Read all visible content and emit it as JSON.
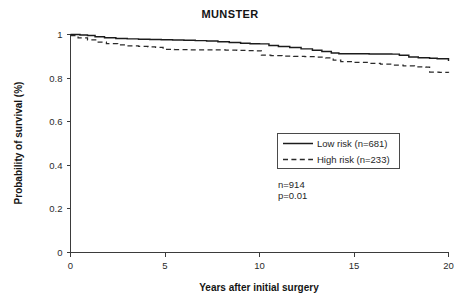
{
  "figure": {
    "background_color": "#ffffff",
    "line_color": "#1c1c1c"
  },
  "chart_data": {
    "type": "line",
    "title": "MUNSTER",
    "xlabel": "Years after initial surgery",
    "ylabel": "Probability of survival (%)",
    "xlim": [
      0,
      20
    ],
    "ylim": [
      0,
      1
    ],
    "xticks": [
      0,
      5,
      10,
      15,
      20
    ],
    "xtick_labels": [
      "0",
      "5",
      "10",
      "15",
      "20"
    ],
    "yticks": [
      0,
      0.2,
      0.4,
      0.6,
      0.8,
      1
    ],
    "ytick_labels": [
      "0",
      "0.2",
      "0.4",
      "0.6",
      "0.8",
      "1"
    ],
    "grid": false,
    "legend_position": "center-right",
    "series": [
      {
        "name": "Low risk (n=681)",
        "style": "solid",
        "color": "#1c1c1c",
        "n": 681,
        "x": [
          0.0,
          0.5,
          0.9,
          1.3,
          1.8,
          2.4,
          3.0,
          3.6,
          4.2,
          4.8,
          5.4,
          6.0,
          6.6,
          7.2,
          7.8,
          8.4,
          9.0,
          9.5,
          10.0,
          10.5,
          11.0,
          11.6,
          12.2,
          12.8,
          13.3,
          13.8,
          14.2,
          15.0,
          15.8,
          16.5,
          17.0,
          17.4,
          17.9,
          18.4,
          19.0,
          19.4,
          20.0
        ],
        "y": [
          1.0,
          0.998,
          0.995,
          0.99,
          0.985,
          0.982,
          0.98,
          0.978,
          0.977,
          0.976,
          0.975,
          0.974,
          0.972,
          0.97,
          0.967,
          0.963,
          0.96,
          0.958,
          0.957,
          0.95,
          0.945,
          0.94,
          0.934,
          0.928,
          0.922,
          0.915,
          0.912,
          0.912,
          0.911,
          0.911,
          0.91,
          0.905,
          0.897,
          0.893,
          0.891,
          0.889,
          0.878
        ]
      },
      {
        "name": "High risk (n=233)",
        "style": "dashed",
        "color": "#2a2a2a",
        "n": 233,
        "x": [
          0.0,
          0.4,
          0.9,
          1.4,
          1.9,
          2.5,
          3.0,
          3.6,
          4.1,
          4.5,
          4.9,
          5.5,
          6.2,
          6.9,
          7.6,
          8.2,
          8.8,
          9.3,
          9.8,
          10.1,
          10.6,
          11.2,
          11.8,
          12.4,
          13.0,
          13.5,
          13.9,
          14.3,
          15.0,
          15.7,
          16.4,
          17.0,
          17.6,
          18.2,
          18.8,
          19.0,
          19.5,
          20.0
        ],
        "y": [
          0.995,
          0.985,
          0.975,
          0.965,
          0.958,
          0.952,
          0.948,
          0.945,
          0.943,
          0.941,
          0.932,
          0.931,
          0.93,
          0.93,
          0.929,
          0.928,
          0.927,
          0.926,
          0.925,
          0.905,
          0.903,
          0.901,
          0.9,
          0.898,
          0.896,
          0.893,
          0.882,
          0.876,
          0.872,
          0.868,
          0.864,
          0.86,
          0.856,
          0.852,
          0.85,
          0.828,
          0.826,
          0.824
        ]
      }
    ],
    "annotations": [
      {
        "text": "n=914",
        "x": 11.6,
        "y": 0.3
      },
      {
        "text": "p=0.01",
        "x": 11.6,
        "y": 0.265
      }
    ]
  }
}
